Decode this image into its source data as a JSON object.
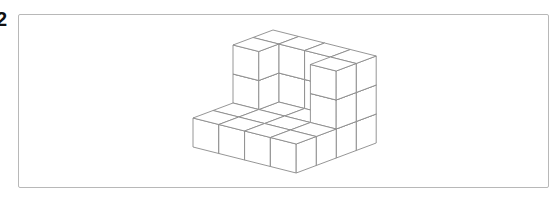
{
  "question": {
    "number": "2"
  },
  "figure": {
    "stroke_color": "#8a8a8a",
    "fill_color": "#ffffff",
    "origin": [
      193,
      147
    ],
    "vec_x": [
      25.8,
      6.5
    ],
    "vec_depth": [
      20,
      -7.5
    ],
    "vec_height": [
      0,
      -29
    ],
    "heights_by_depth_row": [
      [
        1,
        1,
        1,
        1
      ],
      [
        1,
        1,
        1,
        1
      ],
      [
        3,
        1,
        1,
        3
      ],
      [
        3,
        3,
        3,
        3
      ]
    ]
  }
}
